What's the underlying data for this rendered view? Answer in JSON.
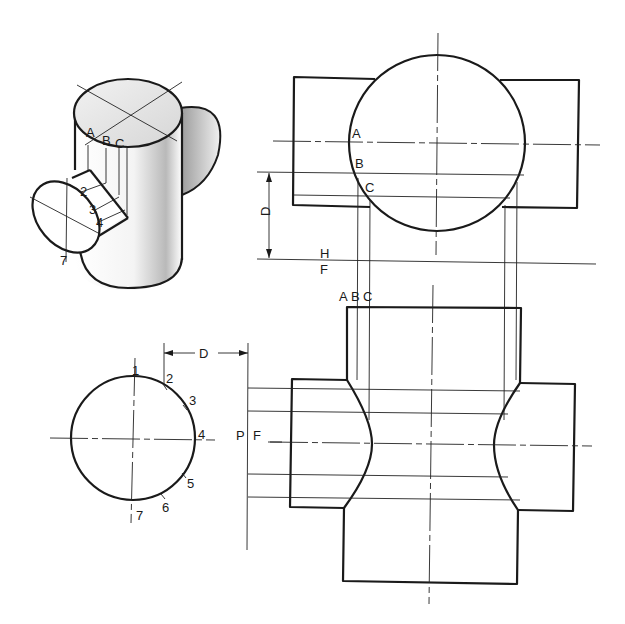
{
  "figure": {
    "type": "orthographic projection of intersecting cylinders",
    "pictorial": {
      "labels": [
        "A",
        "B",
        "C",
        "1",
        "2",
        "3",
        "4",
        "7"
      ]
    },
    "top_view": {
      "point_labels": [
        "A",
        "B",
        "C"
      ],
      "dimension_label": "D",
      "fold_line_labels": {
        "upper": "H",
        "lower": "F"
      }
    },
    "front_view": {
      "column_labels": [
        "A",
        "B",
        "C"
      ]
    },
    "side_view": {
      "point_labels": [
        "1",
        "2",
        "3",
        "4",
        "5",
        "6",
        "7"
      ],
      "dimension_label": "D",
      "fold_line_labels": {
        "left": "P",
        "right": "F"
      }
    }
  },
  "labels": {
    "A": "A",
    "B": "B",
    "C": "C",
    "D": "D",
    "H": "H",
    "F": "F",
    "P": "P",
    "n1": "1",
    "n2": "2",
    "n3": "3",
    "n4": "4",
    "n5": "5",
    "n6": "6",
    "n7": "7"
  }
}
